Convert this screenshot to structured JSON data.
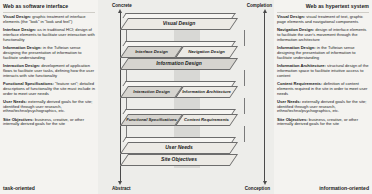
{
  "left_panel": {
    "title": "Web as software interface",
    "bottom_label": "task-oriented",
    "blocks": [
      {
        "term": "Visual Design:",
        "text": " graphic treatment of interface elements (the \"look\" in \"look and feel\")"
      },
      {
        "term": "Interface Design:",
        "text": " as in traditional HCI; design of interface elements to facilitate user interaction with functionality"
      },
      {
        "term": "Information Design:",
        "text": " in the Tufteian sense designing the presentation of information to facilitate understanding"
      },
      {
        "term": "Interaction Design:",
        "text": " development of application flows to facilitate user tasks, defining how the user interacts with site functionality"
      },
      {
        "term": "Functional Specifications:",
        "text": " \"feature set\"; detailed descriptions of functionality the site must include in order to meet user needs"
      },
      {
        "term": "User Needs:",
        "text": " externally derived goals for the site; identified through user research, ethno/techno/psychographics, etc."
      },
      {
        "term": "Site Objectives:",
        "text": " business, creative, or other internally derived goals for the site"
      }
    ]
  },
  "right_panel": {
    "title": "Web as hypertext system",
    "bottom_label": "information-oriented",
    "blocks": [
      {
        "term": "Visual Design:",
        "text": " visual treatment of text, graphic page elements and navigational components"
      },
      {
        "term": "Navigation Design:",
        "text": " design of interface elements to facilitate the user's movement through the information architecture"
      },
      {
        "term": "Information Design:",
        "text": " in the Tufteian sense designing the presentation of information to facilitate understanding"
      },
      {
        "term": "Information Architecture:",
        "text": " structural design of the information space to facilitate intuitive access to content"
      },
      {
        "term": "Content Requirements:",
        "text": " definition of content elements required in the site in order to meet user needs"
      },
      {
        "term": "User Needs:",
        "text": " externally derived goals for the site; identified through user research, ethno/techno/psychographics, etc."
      },
      {
        "term": "Site Objectives:",
        "text": " business, creative, or other internally derived goals for the site"
      }
    ]
  },
  "diagram": {
    "axes": {
      "top_left": "Concrete",
      "top_right": "Completion",
      "bottom_left": "Abstract",
      "bottom_right": "Conception"
    },
    "layers": [
      {
        "id": "visual",
        "single": true,
        "label": "Visual Design"
      },
      {
        "id": "interface-nav",
        "single": false,
        "left": "Interface Design",
        "right": "Navigation Design"
      },
      {
        "id": "information-design",
        "single": true,
        "label": "Information Design"
      },
      {
        "id": "interaction-ia",
        "single": false,
        "left": "Interaction Design",
        "right": "Information Architecture"
      },
      {
        "id": "func-content",
        "single": false,
        "left": "Functional Specifications",
        "right": "Content Requirements"
      },
      {
        "id": "user-needs",
        "single": true,
        "label": "User Needs"
      },
      {
        "id": "site-objectives",
        "single": true,
        "label": "Site Objectives"
      }
    ]
  }
}
